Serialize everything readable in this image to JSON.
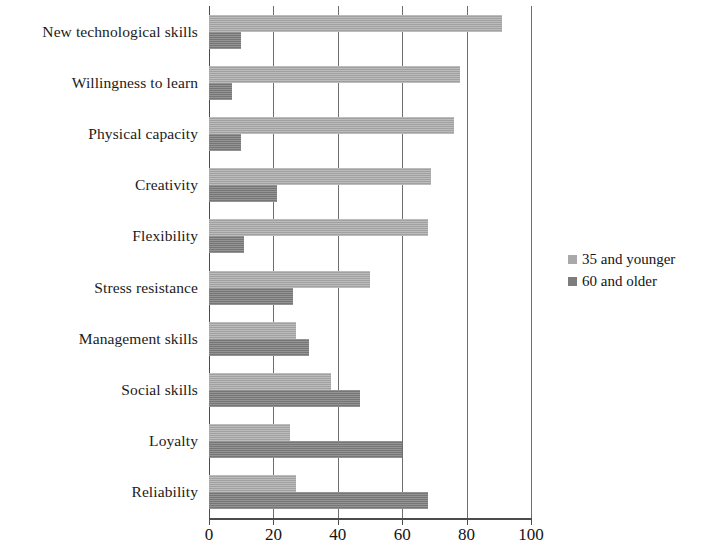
{
  "chart_data": {
    "type": "bar",
    "orientation": "horizontal",
    "title": "",
    "subtitle": "",
    "xlabel": "",
    "ylabel": "",
    "xlim": [
      0,
      100
    ],
    "xticks": [
      0,
      20,
      40,
      60,
      80,
      100
    ],
    "xtick_labels": [
      "0",
      "20",
      "40",
      "60",
      "80",
      "100"
    ],
    "grid": "vertical",
    "legend_position": "right",
    "categories": [
      "New technological skills",
      "Willingness to learn",
      "Physical capacity",
      "Creativity",
      "Flexibility",
      "Stress resistance",
      "Management skills",
      "Social skills",
      "Loyalty",
      "Reliability"
    ],
    "series": [
      {
        "name": "35 and younger",
        "color": "#a9a9a9",
        "values": [
          91,
          78,
          76,
          69,
          68,
          50,
          27,
          38,
          25,
          27
        ]
      },
      {
        "name": "60 and older",
        "color": "#7d7d7d",
        "values": [
          10,
          7,
          10,
          21,
          11,
          26,
          31,
          47,
          60,
          68
        ]
      }
    ]
  },
  "legend": {
    "entries": [
      {
        "label": "35 and younger",
        "marker": "square-swatch-light"
      },
      {
        "label": "60 and older",
        "marker": "square-swatch-dark"
      }
    ]
  },
  "colors": {
    "series_younger": "#a9a9a9",
    "series_older": "#7d7d7d",
    "axis": "#4c4c4c",
    "gridline": "#6e6e6e",
    "text": "#141414",
    "background": "#ffffff"
  }
}
